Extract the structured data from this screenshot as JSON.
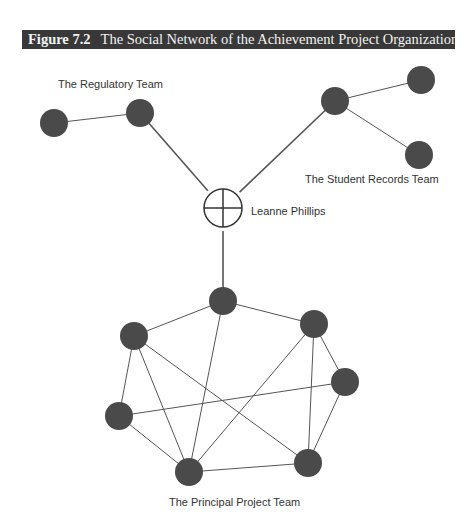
{
  "figure": {
    "number": "Figure 7.2",
    "title": "The Social Network of the Achievement Project Organization"
  },
  "labels": {
    "regulatory_team": "The Regulatory Team",
    "student_records_team": "The Student Records Team",
    "leanne": "Leanne Phillips",
    "principal_team": "The Principal Project Team"
  },
  "colors": {
    "title_bar": "#383838",
    "node_fill": "#4a4a4a",
    "edge": "#555555"
  },
  "network": {
    "center_node": {
      "id": "leanne",
      "name": "Leanne Phillips",
      "x": 223,
      "y": 208,
      "r": 19,
      "symbol": "circle-cross"
    },
    "groups": [
      {
        "name": "The Regulatory Team",
        "nodes": [
          {
            "id": "r1",
            "x": 54,
            "y": 123
          },
          {
            "id": "r2",
            "x": 140,
            "y": 113
          }
        ],
        "edges": [
          [
            "r1",
            "r2"
          ]
        ]
      },
      {
        "name": "The Student Records Team",
        "nodes": [
          {
            "id": "s1",
            "x": 335,
            "y": 101
          },
          {
            "id": "s2",
            "x": 421,
            "y": 80
          },
          {
            "id": "s3",
            "x": 419,
            "y": 155
          }
        ],
        "edges": [
          [
            "s1",
            "s2"
          ],
          [
            "s1",
            "s3"
          ]
        ]
      },
      {
        "name": "The Principal Project Team",
        "nodes": [
          {
            "id": "p1",
            "x": 223,
            "y": 301
          },
          {
            "id": "p2",
            "x": 134,
            "y": 336
          },
          {
            "id": "p3",
            "x": 314,
            "y": 324
          },
          {
            "id": "p4",
            "x": 345,
            "y": 382
          },
          {
            "id": "p5",
            "x": 119,
            "y": 416
          },
          {
            "id": "p6",
            "x": 189,
            "y": 472
          },
          {
            "id": "p7",
            "x": 308,
            "y": 463
          }
        ],
        "edges": [
          [
            "p1",
            "p2"
          ],
          [
            "p1",
            "p3"
          ],
          [
            "p1",
            "p6"
          ],
          [
            "p2",
            "p5"
          ],
          [
            "p2",
            "p6"
          ],
          [
            "p2",
            "p7"
          ],
          [
            "p3",
            "p6"
          ],
          [
            "p3",
            "p7"
          ],
          [
            "p3",
            "p4"
          ],
          [
            "p4",
            "p7"
          ],
          [
            "p4",
            "p5"
          ],
          [
            "p5",
            "p6"
          ],
          [
            "p6",
            "p7"
          ]
        ]
      }
    ],
    "bridge_edges": [
      [
        "leanne",
        "r2"
      ],
      [
        "leanne",
        "s1"
      ],
      [
        "leanne",
        "p1"
      ]
    ],
    "node_radius": 14
  }
}
